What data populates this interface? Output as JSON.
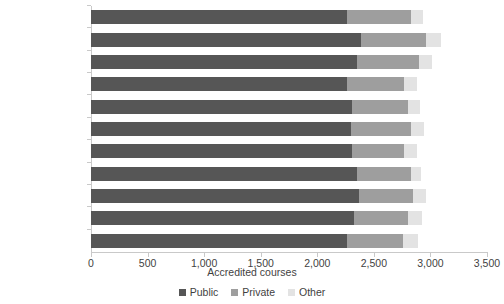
{
  "chart_data": {
    "type": "bar",
    "orientation": "horizontal",
    "stacked": true,
    "title": "",
    "xlabel": "Accredited courses",
    "ylabel": "",
    "xlim": [
      0,
      3500
    ],
    "xticks": [
      0,
      500,
      1000,
      1500,
      2000,
      2500,
      3000,
      3500
    ],
    "xtick_labels": [
      "0",
      "500",
      "1,000",
      "1,500",
      "2,000",
      "2,500",
      "3,000",
      "3,500"
    ],
    "grid": false,
    "legend_position": "bottom",
    "categories": [
      "May 2022",
      "April 2022",
      "March 2022",
      "February 2022",
      "January 2022",
      "December 2021",
      "November 2021",
      "October 2021",
      "September 2021",
      "August 2021",
      "July 2021"
    ],
    "series": [
      {
        "name": "Public",
        "color": "#565656",
        "values": [
          2265,
          2390,
          2355,
          2265,
          2310,
          2300,
          2310,
          2355,
          2365,
          2325,
          2265
        ]
      },
      {
        "name": "Private",
        "color": "#9e9e9e",
        "values": [
          565,
          575,
          540,
          505,
          495,
          530,
          460,
          475,
          485,
          475,
          495
        ]
      },
      {
        "name": "Other",
        "color": "#e3e3e3",
        "values": [
          105,
          125,
          115,
          115,
          105,
          115,
          115,
          90,
          115,
          125,
          130
        ]
      }
    ]
  },
  "legend": {
    "items": [
      {
        "label": "Public",
        "color": "#565656"
      },
      {
        "label": "Private",
        "color": "#9e9e9e"
      },
      {
        "label": "Other",
        "color": "#e3e3e3"
      }
    ]
  }
}
